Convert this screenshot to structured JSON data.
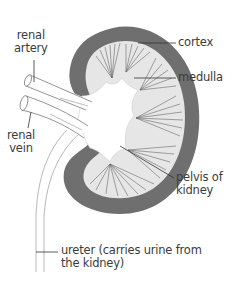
{
  "diagram": {
    "colors": {
      "cortex": "#6f6f6f",
      "medulla": "#e6e6e6",
      "pelvis": "#ffffff",
      "lines": "#555555",
      "vessel_stroke": "#7a7a7a",
      "text": "#3b3b3b"
    },
    "labels": {
      "renal_artery_line1": "renal",
      "renal_artery_line2": "artery",
      "renal_vein_line1": "renal",
      "renal_vein_line2": "vein",
      "cortex": "cortex",
      "medulla": "medulla",
      "pelvis_line1": "pelvis of",
      "pelvis_line2": "kidney",
      "ureter_line1": "ureter (carries urine from",
      "ureter_line2": "the kidney)"
    }
  }
}
